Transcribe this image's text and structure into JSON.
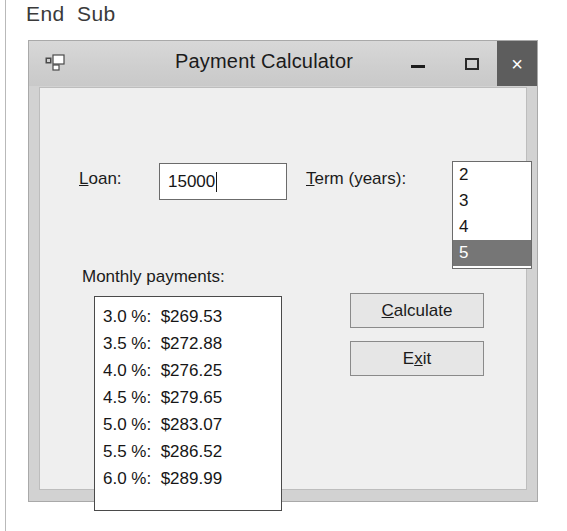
{
  "code_context": {
    "line": "End  Sub"
  },
  "window": {
    "title": "Payment Calculator",
    "icon": "vb-form-icon",
    "controls": {
      "minimize": "–",
      "maximize": "□",
      "close": "×"
    }
  },
  "form": {
    "loan": {
      "label_prefix": "",
      "label_accel": "L",
      "label_rest": "oan:",
      "value": "15000",
      "placeholder": ""
    },
    "term": {
      "label_accel": "T",
      "label_rest": "erm (years):",
      "options": [
        "2",
        "3",
        "4",
        "5"
      ],
      "selected": "5"
    },
    "monthly": {
      "label": "Monthly payments:",
      "rows": [
        "3.0 %:  $269.53",
        "3.5 %:  $272.88",
        "4.0 %:  $276.25",
        "4.5 %:  $279.65",
        "5.0 %:  $283.07",
        "5.5 %:  $286.52",
        "6.0 %:  $289.99"
      ]
    },
    "buttons": {
      "calculate": {
        "accel": "C",
        "rest": "alculate"
      },
      "exit": {
        "prefix": "E",
        "accel": "x",
        "rest": "it"
      }
    }
  },
  "colors": {
    "titlebar": "#cfcfcf",
    "close_button": "#5d5d5d",
    "selection": "#767676",
    "client": "#efefef",
    "window_chrome": "#d2d2d2"
  }
}
